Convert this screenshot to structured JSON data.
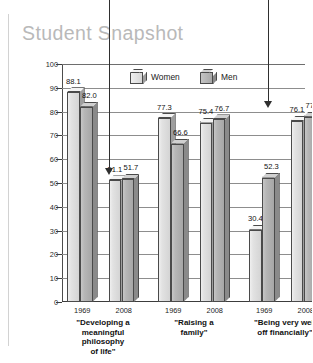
{
  "title": "Student Snapshot",
  "legend": {
    "position": "top-center",
    "items": [
      {
        "label": "Women",
        "icon": "cube-light-icon",
        "color": "#dcdcdc"
      },
      {
        "label": "Men",
        "icon": "cube-dark-icon",
        "color": "#b0b0b0"
      }
    ]
  },
  "yaxis": {
    "title": "Percentage Calling Objective\n\"Essential\" or \"Very Important\"",
    "ticks": [
      "100",
      "90",
      "80",
      "70",
      "60",
      "50",
      "40",
      "30",
      "20",
      "10",
      "0"
    ]
  },
  "annotations": [
    {
      "name": "arrow-to-2008-philosophy",
      "text": ""
    },
    {
      "name": "arrow-to-2008-financial",
      "text": ""
    }
  ],
  "chart_data": {
    "type": "bar",
    "title": "Student Snapshot",
    "xlabel": "",
    "ylabel": "Percentage Calling Objective \"Essential\" or \"Very Important\"",
    "ylim": [
      0,
      100
    ],
    "ytick_step": 10,
    "grid": true,
    "legend_position": "top-center",
    "groups": [
      {
        "category": "\"Developing a\nmeaningful\nphilosophy\nof life\"",
        "years": [
          {
            "year": "1969",
            "Women": 88.1,
            "Men": 82.0
          },
          {
            "year": "2008",
            "Women": 51.1,
            "Men": 51.7
          }
        ]
      },
      {
        "category": "\"Raising a\nfamily\"",
        "years": [
          {
            "year": "1969",
            "Women": 77.3,
            "Men": 66.6
          },
          {
            "year": "2008",
            "Women": 75.4,
            "Men": 76.7
          }
        ]
      },
      {
        "category": "\"Being very well\noff financially\"",
        "years": [
          {
            "year": "1969",
            "Women": 30.4,
            "Men": 52.3
          },
          {
            "year": "2008",
            "Women": 76.1,
            "Men": 77.8
          }
        ]
      }
    ],
    "series": [
      {
        "name": "Women",
        "values": [
          88.1,
          51.1,
          77.3,
          75.4,
          30.4,
          76.1
        ]
      },
      {
        "name": "Men",
        "values": [
          82.0,
          51.7,
          66.6,
          76.7,
          52.3,
          77.8
        ]
      }
    ],
    "categories": [
      "Developing a meaningful philosophy of life – 1969",
      "Developing a meaningful philosophy of life – 2008",
      "Raising a family – 1969",
      "Raising a family – 2008",
      "Being very well off financially – 1969",
      "Being very well off financially – 2008"
    ]
  }
}
